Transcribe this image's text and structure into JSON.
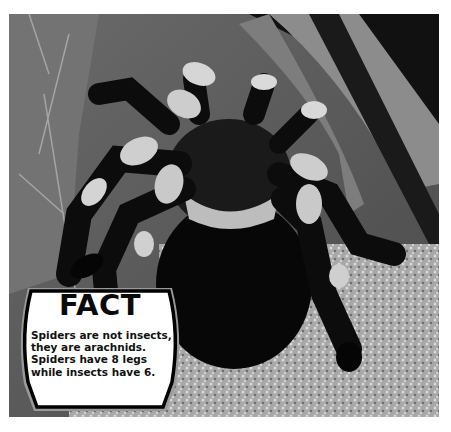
{
  "image": {
    "subject": "tarantula-photo",
    "tone": "grayscale"
  },
  "fact_card": {
    "title": "FACT",
    "lines": [
      "Spiders are not insects,",
      "they are arachnids.",
      "Spiders have 8 legs",
      "while insects have 6."
    ],
    "border_color": "#000000",
    "background_color": "#ffffff"
  }
}
